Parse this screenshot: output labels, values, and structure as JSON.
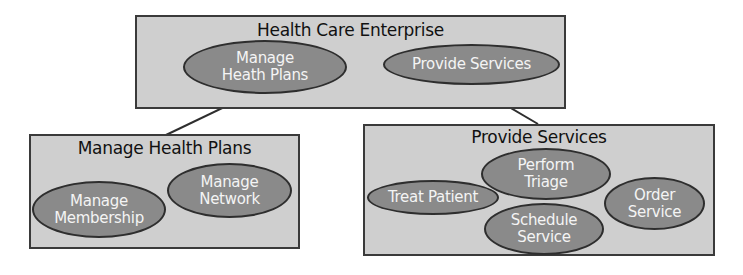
{
  "diagram": {
    "top": {
      "title": "Health Care Enterprise",
      "nodes": [
        {
          "label": "Manage Heath Plans"
        },
        {
          "label": "Provide Services"
        }
      ]
    },
    "left": {
      "title": "Manage Health Plans",
      "nodes": [
        {
          "label": "Manage Membership"
        },
        {
          "label": "Manage Network"
        }
      ]
    },
    "right": {
      "title": "Provide Services",
      "nodes": [
        {
          "label": "Treat Patient"
        },
        {
          "label": "Perform Triage"
        },
        {
          "label": "Schedule Service"
        },
        {
          "label": "Order Service"
        }
      ]
    }
  },
  "colors": {
    "box_fill": "#cfcfcf",
    "ellipse_fill": "#8a8a8a",
    "stroke": "#2e2e2e"
  }
}
